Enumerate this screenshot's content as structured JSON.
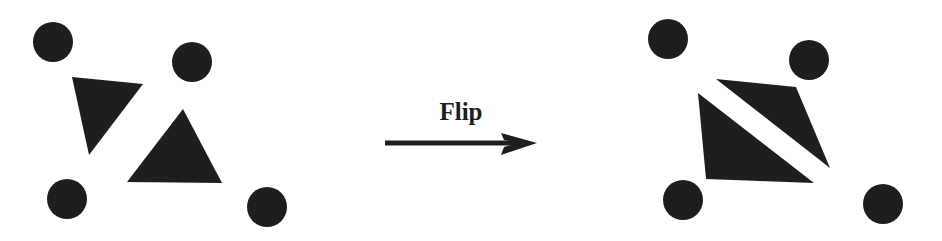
{
  "diagram": {
    "fill_color": "#1e1e1e",
    "background_color": "#ffffff",
    "arrow": {
      "label": "Flip",
      "x1": 385,
      "y1": 143,
      "x2": 537,
      "y2": 143,
      "stroke_width": 5
    },
    "before": {
      "name": "before-configuration",
      "circles": [
        {
          "cx": 53,
          "cy": 42,
          "r": 20
        },
        {
          "cx": 192,
          "cy": 62,
          "r": 20
        },
        {
          "cx": 67,
          "cy": 199,
          "r": 20
        },
        {
          "cx": 267,
          "cy": 207,
          "r": 20
        }
      ],
      "triangles": [
        {
          "points": "72,77 143,84 89,155"
        },
        {
          "points": "183,109 127,182 222,183"
        }
      ]
    },
    "after": {
      "name": "after-configuration",
      "circles": [
        {
          "cx": 668,
          "cy": 39,
          "r": 20
        },
        {
          "cx": 809,
          "cy": 60,
          "r": 20
        },
        {
          "cx": 683,
          "cy": 200,
          "r": 20
        },
        {
          "cx": 883,
          "cy": 204,
          "r": 20
        }
      ],
      "triangles": [
        {
          "points": "716,79 796,87 830,168"
        },
        {
          "points": "698,93 706,179 814,183"
        }
      ]
    }
  }
}
